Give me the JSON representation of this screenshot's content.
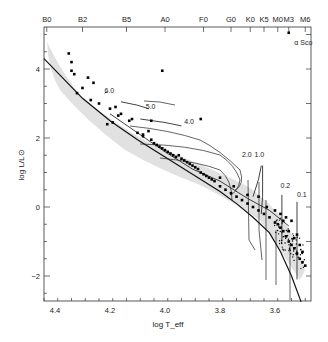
{
  "chart_data": {
    "type": "scatter",
    "title": "",
    "xlabel": "log T_eff",
    "ylabel": "log L/L⊙",
    "xlim": [
      4.44,
      3.47
    ],
    "ylim": [
      -2.75,
      5.2
    ],
    "x_reversed": true,
    "grid": false,
    "legend": null,
    "x_ticks": [
      4.4,
      4.2,
      4.0,
      3.8,
      3.6
    ],
    "x_tick_labels": [
      "4.4",
      "4.2",
      "4.0",
      "3.8",
      "3.6"
    ],
    "y_ticks": [
      4,
      2,
      0,
      -2
    ],
    "y_tick_labels": [
      "4",
      "2",
      "0",
      "−2"
    ],
    "top_axis": {
      "label": "Spectral type",
      "ticks": [
        {
          "label": "B0",
          "logT": 4.43
        },
        {
          "label": "B2",
          "logT": 4.3
        },
        {
          "label": "B5",
          "logT": 4.14
        },
        {
          "label": "A0",
          "logT": 4.0
        },
        {
          "label": "F0",
          "logT": 3.86
        },
        {
          "label": "G0",
          "logT": 3.76
        },
        {
          "label": "K0",
          "logT": 3.69
        },
        {
          "label": "K5",
          "logT": 3.64
        },
        {
          "label": "M0",
          "logT": 3.59
        },
        {
          "label": "M3",
          "logT": 3.55
        },
        {
          "label": "M6",
          "logT": 3.49
        }
      ]
    },
    "annotations": [
      {
        "text": "α Sco",
        "logT": 3.53,
        "logL": 4.7
      },
      {
        "text": "6.0",
        "logT": 4.22,
        "logL": 3.3
      },
      {
        "text": "5.0",
        "logT": 4.07,
        "logL": 2.85
      },
      {
        "text": "4.0",
        "logT": 3.93,
        "logL": 2.4
      },
      {
        "text": "2.0",
        "logT": 3.72,
        "logL": 1.45
      },
      {
        "text": "1.0",
        "logT": 3.675,
        "logL": 1.45
      },
      {
        "text": "0.2",
        "logT": 3.58,
        "logL": 0.55
      },
      {
        "text": "0.1",
        "logT": 3.52,
        "logL": 0.3
      }
    ],
    "series": [
      {
        "name": "ZAMS",
        "kind": "line",
        "points": [
          [
            4.44,
            4.3
          ],
          [
            4.3,
            3.15
          ],
          [
            4.2,
            2.5
          ],
          [
            4.1,
            1.95
          ],
          [
            4.0,
            1.45
          ],
          [
            3.9,
            0.95
          ],
          [
            3.8,
            0.45
          ],
          [
            3.74,
            0.1
          ],
          [
            3.68,
            -0.3
          ],
          [
            3.62,
            -0.75
          ],
          [
            3.58,
            -1.3
          ],
          [
            3.54,
            -2.0
          ],
          [
            3.505,
            -2.75
          ]
        ]
      },
      {
        "name": "Birthline",
        "kind": "line",
        "points": [
          [
            4.2,
            2.7
          ],
          [
            4.1,
            2.15
          ],
          [
            4.0,
            1.6
          ],
          [
            3.9,
            1.1
          ],
          [
            3.8,
            0.75
          ],
          [
            3.7,
            0.25
          ],
          [
            3.62,
            -0.1
          ],
          [
            3.55,
            -0.55
          ]
        ]
      },
      {
        "name": "Track 6.0 Msun",
        "kind": "line",
        "points": [
          [
            4.21,
            3.35
          ],
          [
            4.22,
            3.3
          ]
        ]
      },
      {
        "name": "Track 5.0 Msun",
        "kind": "line",
        "points": [
          [
            4.16,
            3.05
          ],
          [
            4.1,
            2.95
          ],
          [
            4.06,
            2.85
          ]
        ]
      },
      {
        "name": "Track 4.0 Msun",
        "kind": "line",
        "points": [
          [
            4.09,
            2.55
          ],
          [
            4.0,
            2.45
          ],
          [
            3.94,
            2.35
          ]
        ]
      },
      {
        "name": "Track 2.0 Msun",
        "kind": "line",
        "points": [
          [
            3.65,
            1.2
          ],
          [
            3.66,
            0.8
          ],
          [
            3.68,
            0.3
          ]
        ]
      },
      {
        "name": "Track 1.0 Msun",
        "kind": "line",
        "points": [
          [
            3.645,
            1.2
          ],
          [
            3.645,
            0.3
          ],
          [
            3.65,
            -0.2
          ]
        ]
      },
      {
        "name": "Track 0.2 Msun",
        "kind": "line",
        "points": [
          [
            3.575,
            0.35
          ],
          [
            3.575,
            -1.0
          ]
        ]
      },
      {
        "name": "Track 0.1 Msun",
        "kind": "line",
        "points": [
          [
            3.52,
            0.15
          ],
          [
            3.52,
            -2.1
          ]
        ]
      },
      {
        "name": "Stars",
        "kind": "scatter",
        "points": [
          [
            4.34,
            4.2
          ],
          [
            4.35,
            4.45
          ],
          [
            4.33,
            3.85
          ],
          [
            4.3,
            3.45
          ],
          [
            4.34,
            3.95
          ],
          [
            4.28,
            3.75
          ],
          [
            4.32,
            3.3
          ],
          [
            4.27,
            3.1
          ],
          [
            4.24,
            3.0
          ],
          [
            4.26,
            3.6
          ],
          [
            4.2,
            2.85
          ],
          [
            4.18,
            2.9
          ],
          [
            4.21,
            2.4
          ],
          [
            4.19,
            2.45
          ],
          [
            4.17,
            2.65
          ],
          [
            4.16,
            2.7
          ],
          [
            4.12,
            2.55
          ],
          [
            4.13,
            2.5
          ],
          [
            4.01,
            3.95
          ],
          [
            3.87,
            2.55
          ],
          [
            4.05,
            2.5
          ],
          [
            4.06,
            2.2
          ],
          [
            4.08,
            2.05
          ],
          [
            4.1,
            2.15
          ],
          [
            4.08,
            2.1
          ],
          [
            4.05,
            1.95
          ],
          [
            4.04,
            1.85
          ],
          [
            4.03,
            1.8
          ],
          [
            4.02,
            1.75
          ],
          [
            4.01,
            1.7
          ],
          [
            4.0,
            1.65
          ],
          [
            3.99,
            1.6
          ],
          [
            3.98,
            1.55
          ],
          [
            3.97,
            1.5
          ],
          [
            3.96,
            1.45
          ],
          [
            3.95,
            1.5
          ],
          [
            3.94,
            1.4
          ],
          [
            3.93,
            1.35
          ],
          [
            3.92,
            1.3
          ],
          [
            3.91,
            1.25
          ],
          [
            3.9,
            1.2
          ],
          [
            3.89,
            1.15
          ],
          [
            3.88,
            1.1
          ],
          [
            3.87,
            1.0
          ],
          [
            3.86,
            0.95
          ],
          [
            3.85,
            0.9
          ],
          [
            3.84,
            0.85
          ],
          [
            3.83,
            0.8
          ],
          [
            3.82,
            0.75
          ],
          [
            3.8,
            0.6
          ],
          [
            3.78,
            0.5
          ],
          [
            3.76,
            0.4
          ],
          [
            3.74,
            0.3
          ],
          [
            3.72,
            0.2
          ],
          [
            3.7,
            0.1
          ],
          [
            3.68,
            0.0
          ],
          [
            3.66,
            -0.1
          ],
          [
            3.64,
            -0.2
          ],
          [
            3.62,
            -0.3
          ],
          [
            3.6,
            -0.45
          ],
          [
            3.59,
            -0.5
          ],
          [
            3.58,
            -0.6
          ],
          [
            3.57,
            -0.7
          ],
          [
            3.56,
            -0.85
          ],
          [
            3.55,
            -1.0
          ],
          [
            3.54,
            -1.1
          ],
          [
            3.53,
            -1.2
          ],
          [
            3.52,
            -1.35
          ],
          [
            3.51,
            -1.5
          ],
          [
            3.5,
            -1.6
          ],
          [
            3.49,
            -1.7
          ],
          [
            3.53,
            -0.9
          ],
          [
            3.55,
            -0.7
          ],
          [
            3.57,
            -0.4
          ],
          [
            3.56,
            -0.3
          ],
          [
            3.52,
            -0.8
          ],
          [
            3.51,
            -1.1
          ],
          [
            3.5,
            -1.3
          ],
          [
            3.54,
            -0.4
          ],
          [
            3.58,
            -0.2
          ],
          [
            3.6,
            -0.1
          ],
          [
            3.63,
            0.0
          ],
          [
            3.66,
            0.3
          ],
          [
            3.7,
            0.35
          ],
          [
            3.75,
            0.6
          ],
          [
            3.8,
            0.85
          ]
        ]
      },
      {
        "name": "alpha Sco",
        "kind": "scatter",
        "points": [
          [
            3.55,
            5.05
          ]
        ]
      }
    ]
  }
}
